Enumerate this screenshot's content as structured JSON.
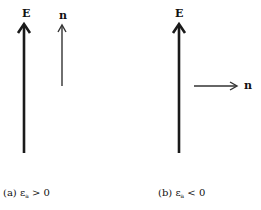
{
  "figure": {
    "panel_a": {
      "field_label": "E",
      "normal_label": "n",
      "caption_prefix": "(a) ε",
      "caption_sub": "a",
      "caption_suffix": " > 0",
      "normal_direction": "parallel to E (up)"
    },
    "panel_b": {
      "field_label": "E",
      "normal_label": "n",
      "caption_prefix": "(b) ε",
      "caption_sub": "a",
      "caption_suffix": " < 0",
      "normal_direction": "perpendicular to E (right)"
    },
    "colors": {
      "field_arrow": "#1a1a1a",
      "normal_arrow": "#333333",
      "background": "#ffffff"
    }
  }
}
